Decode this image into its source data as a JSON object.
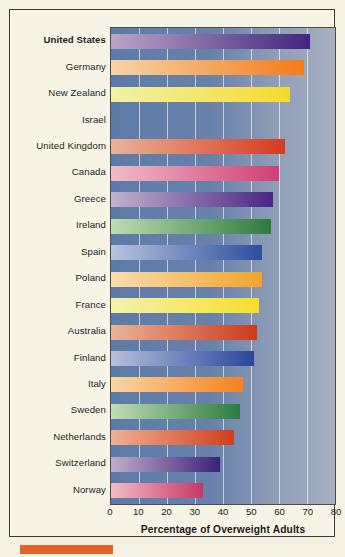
{
  "chart_data": {
    "type": "bar",
    "orientation": "horizontal",
    "title": "",
    "xlabel": "Percentage of Overweight Adults",
    "ylabel": "",
    "xlim": [
      0,
      80
    ],
    "xticks": [
      0,
      10,
      20,
      30,
      40,
      50,
      60,
      70,
      80
    ],
    "grid": true,
    "legend": null,
    "categories": [
      "United States",
      "Germany",
      "New Zealand",
      "Israel",
      "United Kingdom",
      "Canada",
      "Greece",
      "Ireland",
      "Spain",
      "Poland",
      "France",
      "Australia",
      "Finland",
      "Italy",
      "Sweden",
      "Netherlands",
      "Switzerland",
      "Norway"
    ],
    "values": [
      71,
      69,
      64,
      64,
      62,
      60,
      58,
      57,
      54,
      54,
      53,
      52,
      51,
      47,
      46,
      44,
      39,
      33
    ],
    "bars": [
      {
        "label": "United States",
        "value": 71,
        "highlight": true,
        "color_light": "#b9a6c4",
        "color_dark": "#43257f"
      },
      {
        "label": "Germany",
        "value": 69,
        "highlight": false,
        "color_light": "#f6d5a6",
        "color_dark": "#f47b1b"
      },
      {
        "label": "New Zealand",
        "value": 64,
        "highlight": false,
        "color_light": "#f2f2a8",
        "color_dark": "#f5d92e"
      },
      {
        "label": "Israel",
        "value": 64,
        "highlight": false,
        "color_light": "#f7ddb4",
        "color_dark": "#f2b githubusercontent"
      },
      {
        "label": "United Kingdom",
        "value": 62,
        "highlight": false,
        "color_light": "#e8b49a",
        "color_dark": "#d63a1e"
      },
      {
        "label": "Canada",
        "value": 60,
        "highlight": false,
        "color_light": "#f0bcc9",
        "color_dark": "#cf3f74"
      },
      {
        "label": "Greece",
        "value": 58,
        "highlight": false,
        "color_light": "#c3b1cd",
        "color_dark": "#4b2586"
      },
      {
        "label": "Ireland",
        "value": 57,
        "highlight": false,
        "color_light": "#bedcb3",
        "color_dark": "#2f7a3e"
      },
      {
        "label": "Spain",
        "value": 54,
        "highlight": false,
        "color_light": "#b9c4dc",
        "color_dark": "#2b4ea0"
      },
      {
        "label": "Poland",
        "value": 54,
        "highlight": false,
        "color_light": "#f8dcae",
        "color_dark": "#f0a52a"
      },
      {
        "label": "France",
        "value": 53,
        "highlight": false,
        "color_light": "#f3f3ae",
        "color_dark": "#f7de2b"
      },
      {
        "label": "Australia",
        "value": 52,
        "highlight": false,
        "color_light": "#e9b39a",
        "color_dark": "#cc3a1c"
      },
      {
        "label": "Finland",
        "value": 51,
        "highlight": false,
        "color_light": "#b6c0da",
        "color_dark": "#28479b"
      },
      {
        "label": "Italy",
        "value": 47,
        "highlight": false,
        "color_light": "#f8d6a4",
        "color_dark": "#f4821f"
      },
      {
        "label": "Sweden",
        "value": 46,
        "highlight": false,
        "color_light": "#c0ddb4",
        "color_dark": "#2e7b3f"
      },
      {
        "label": "Netherlands",
        "value": 44,
        "highlight": false,
        "color_light": "#eeb192",
        "color_dark": "#cf3f1c"
      },
      {
        "label": "Switzerland",
        "value": 39,
        "highlight": false,
        "color_light": "#c0aec9",
        "color_dark": "#3b2179"
      },
      {
        "label": "Norway",
        "value": 33,
        "highlight": false,
        "color_light": "#f2bcc6",
        "color_dark": "#c73864"
      }
    ]
  },
  "colors": {
    "paper": "#f7f4e6",
    "plot_field_left": "#5d7ba8",
    "plot_field_right": "#a8b0c2",
    "frame": "#3a3a38",
    "accent": "#e2622a",
    "gridline": "#ffffff",
    "text": "#1c1b19"
  },
  "accent_bar": {
    "name": "bottom-accent-rule"
  }
}
